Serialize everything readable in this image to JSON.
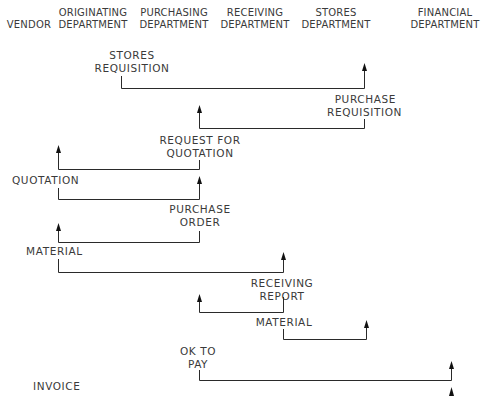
{
  "columns": [
    {
      "id": "vendor",
      "line1": "",
      "line2": "VENDOR"
    },
    {
      "id": "originating",
      "line1": "ORIGINATING",
      "line2": "DEPARTMENT"
    },
    {
      "id": "purchasing",
      "line1": "PURCHASING",
      "line2": "DEPARTMENT"
    },
    {
      "id": "receiving",
      "line1": "RECEIVING",
      "line2": "DEPARTMENT"
    },
    {
      "id": "stores",
      "line1": "STORES",
      "line2": "DEPARTMENT"
    },
    {
      "id": "financial",
      "line1": "FINANCIAL",
      "line2": "DEPARTMENT"
    }
  ],
  "flows": [
    {
      "id": "stores-requisition",
      "line1": "STORES",
      "line2": "REQUISITION",
      "from": "originating",
      "to": "stores"
    },
    {
      "id": "purchase-requisition",
      "line1": "PURCHASE",
      "line2": "REQUISITION",
      "from": "stores",
      "to": "purchasing"
    },
    {
      "id": "request-for-quotation",
      "line1": "REQUEST FOR",
      "line2": "QUOTATION",
      "from": "purchasing",
      "to": "vendor"
    },
    {
      "id": "quotation",
      "line1": "QUOTATION",
      "line2": "",
      "from": "vendor",
      "to": "purchasing"
    },
    {
      "id": "purchase-order",
      "line1": "PURCHASE",
      "line2": "ORDER",
      "from": "purchasing",
      "to": "vendor"
    },
    {
      "id": "material-1",
      "line1": "MATERIAL",
      "line2": "",
      "from": "vendor",
      "to": "receiving"
    },
    {
      "id": "receiving-report",
      "line1": "RECEIVING",
      "line2": "REPORT",
      "from": "receiving",
      "to": "purchasing"
    },
    {
      "id": "material-2",
      "line1": "MATERIAL",
      "line2": "",
      "from": "receiving",
      "to": "stores"
    },
    {
      "id": "ok-to-pay",
      "line1": "OK TO",
      "line2": "PAY",
      "from": "purchasing",
      "to": "financial"
    },
    {
      "id": "invoice",
      "line1": "INVOICE",
      "line2": "",
      "from": "vendor",
      "to": "financial"
    }
  ]
}
